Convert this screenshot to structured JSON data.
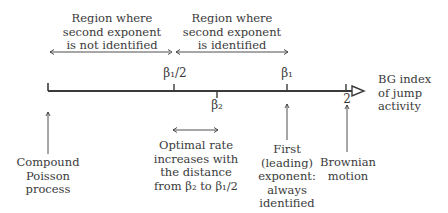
{
  "top_regions": {
    "not_identified": {
      "line1": "Region where",
      "line2": "second exponent",
      "line3": "is not identified"
    },
    "identified": {
      "line1": "Region where",
      "line2": "second exponent",
      "line3": "is identified"
    }
  },
  "axis": {
    "label_line1": "BG index",
    "label_line2": "of jump",
    "label_line3": "activity",
    "ticks": {
      "beta1_half": "β₁/2",
      "beta2": "β₂",
      "beta1": "β₁",
      "two": "2"
    }
  },
  "annotations": {
    "compound_poisson": {
      "line1": "Compound",
      "line2": "Poisson",
      "line3": "process"
    },
    "optimal_rate": {
      "line1": "Optimal rate",
      "line2": "increases with",
      "line3": "the distance",
      "line4": "from β₂ to β₁/2"
    },
    "first_exponent": {
      "line1": "First",
      "line2": "(leading)",
      "line3": "exponent:",
      "line4": "always",
      "line5": "identified"
    },
    "brownian": {
      "line1": "Brownian",
      "line2": "motion"
    }
  },
  "colors": {
    "ink": "#3a3a3a",
    "background": "#ffffff"
  }
}
